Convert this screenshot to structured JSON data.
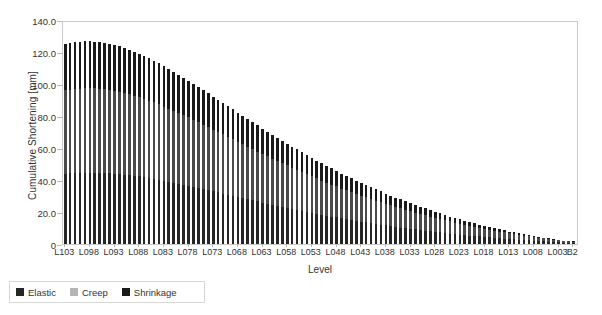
{
  "chart_data": {
    "type": "bar",
    "title": "",
    "subtitle": "",
    "xlabel": "Level",
    "ylabel": "Cumulative Shortening [mm]",
    "ylim": [
      0,
      140
    ],
    "ytick_labels": [
      "140.0",
      "120.0",
      "100.0",
      "80.0",
      "60.0",
      "40.0",
      "20.0",
      "0"
    ],
    "ytick_values": [
      140,
      120,
      100,
      80,
      60,
      40,
      20,
      0
    ],
    "grid": false,
    "legend_position": "below-left",
    "stacked": true,
    "bar_orientation": "vertical",
    "categories": [
      "L103",
      "L102",
      "L101",
      "L100",
      "L099",
      "L098",
      "L097",
      "L096",
      "L095",
      "L094",
      "L093",
      "L092",
      "L091",
      "L090",
      "L089",
      "L088",
      "L087",
      "L086",
      "L085",
      "L084",
      "L083",
      "L082",
      "L081",
      "L080",
      "L079",
      "L078",
      "L077",
      "L076",
      "L075",
      "L074",
      "L073",
      "L072",
      "L071",
      "L070",
      "L069",
      "L068",
      "L067",
      "L066",
      "L065",
      "L064",
      "L063",
      "L062",
      "L061",
      "L060",
      "L059",
      "L058",
      "L057",
      "L056",
      "L055",
      "L054",
      "L053",
      "L052",
      "L051",
      "L050",
      "L049",
      "L048",
      "L047",
      "L046",
      "L045",
      "L044",
      "L043",
      "L042",
      "L041",
      "L040",
      "L039",
      "L038",
      "L037",
      "L036",
      "L035",
      "L034",
      "L033",
      "L032",
      "L031",
      "L030",
      "L029",
      "L028",
      "L027",
      "L026",
      "L025",
      "L024",
      "L023",
      "L022",
      "L021",
      "L020",
      "L019",
      "L018",
      "L017",
      "L016",
      "L015",
      "L014",
      "L013",
      "L012",
      "L011",
      "L010",
      "L009",
      "L008",
      "L007",
      "L006",
      "L005",
      "L004",
      "L003",
      "L002",
      "L001",
      "B2"
    ],
    "xtick_labels": [
      "L103",
      "L098",
      "L093",
      "L088",
      "L083",
      "L078",
      "L073",
      "L068",
      "L063",
      "L058",
      "L053",
      "L048",
      "L043",
      "L038",
      "L033",
      "L028",
      "L023",
      "L018",
      "L013",
      "L008",
      "L003",
      "B2"
    ],
    "xtick_indices": [
      0,
      5,
      10,
      15,
      20,
      25,
      30,
      35,
      40,
      45,
      50,
      55,
      60,
      65,
      70,
      75,
      80,
      85,
      90,
      95,
      100,
      103
    ],
    "series": [
      {
        "name": "Elastic",
        "color": "#262626",
        "values": [
          44.0,
          44.2,
          44.4,
          44.5,
          44.6,
          44.6,
          44.6,
          44.5,
          44.4,
          44.2,
          44.0,
          43.7,
          43.4,
          43.0,
          42.6,
          42.2,
          41.7,
          41.2,
          40.7,
          40.1,
          39.5,
          38.9,
          38.3,
          37.7,
          37.0,
          36.4,
          35.7,
          35.0,
          34.3,
          33.6,
          32.9,
          32.2,
          31.5,
          30.8,
          30.1,
          29.4,
          28.7,
          28.0,
          27.3,
          26.6,
          25.9,
          25.2,
          24.5,
          23.9,
          23.2,
          22.6,
          21.9,
          21.3,
          20.7,
          20.1,
          19.5,
          18.9,
          18.3,
          17.7,
          17.1,
          16.6,
          16.0,
          15.5,
          15.0,
          14.5,
          14.0,
          13.5,
          13.0,
          12.5,
          12.1,
          11.6,
          11.2,
          10.7,
          10.3,
          9.9,
          9.5,
          9.1,
          8.7,
          8.3,
          7.9,
          7.6,
          7.2,
          6.9,
          6.5,
          6.2,
          5.9,
          5.6,
          5.3,
          5.0,
          4.7,
          4.4,
          4.1,
          3.9,
          3.6,
          3.4,
          3.1,
          2.9,
          2.7,
          2.5,
          2.2,
          2.0,
          1.8,
          1.6,
          1.5,
          1.3,
          1.1,
          0.9,
          0.8,
          0.7
        ]
      },
      {
        "name": "Creep",
        "color": "#4a4a4a",
        "values": [
          52.0,
          52.3,
          52.5,
          52.6,
          52.7,
          52.7,
          52.6,
          52.5,
          52.3,
          52.1,
          51.8,
          51.4,
          51.0,
          50.6,
          50.1,
          49.6,
          49.0,
          48.4,
          47.8,
          47.1,
          46.4,
          45.7,
          45.0,
          44.2,
          43.5,
          42.7,
          41.9,
          41.1,
          40.3,
          39.5,
          38.6,
          37.8,
          37.0,
          36.2,
          35.3,
          34.5,
          33.7,
          32.9,
          32.1,
          31.2,
          30.4,
          29.6,
          28.8,
          28.0,
          27.3,
          26.5,
          25.7,
          25.0,
          24.2,
          23.5,
          22.8,
          22.1,
          21.4,
          20.7,
          20.0,
          19.4,
          18.7,
          18.1,
          17.5,
          16.9,
          16.3,
          15.7,
          15.2,
          14.6,
          14.1,
          13.5,
          13.0,
          12.5,
          12.0,
          11.5,
          11.0,
          10.6,
          10.1,
          9.7,
          9.3,
          8.8,
          8.4,
          8.0,
          7.6,
          7.2,
          6.9,
          6.5,
          6.1,
          5.8,
          5.5,
          5.1,
          4.8,
          4.5,
          4.2,
          3.9,
          3.6,
          3.4,
          3.1,
          2.8,
          2.6,
          2.4,
          2.1,
          1.9,
          1.7,
          1.5,
          1.3,
          1.1,
          0.9,
          0.8
        ]
      },
      {
        "name": "Shrinkage",
        "color": "#1a1a1a",
        "values": [
          29.0,
          29.1,
          29.2,
          29.3,
          29.3,
          29.3,
          29.2,
          29.1,
          29.0,
          28.8,
          28.6,
          28.4,
          28.1,
          27.8,
          27.5,
          27.2,
          26.8,
          26.5,
          26.1,
          25.7,
          25.3,
          24.8,
          24.4,
          23.9,
          23.5,
          23.0,
          22.5,
          22.1,
          21.6,
          21.1,
          20.6,
          20.1,
          19.6,
          19.2,
          18.7,
          18.2,
          17.7,
          17.3,
          16.8,
          16.3,
          15.9,
          15.4,
          15.0,
          14.5,
          14.1,
          13.7,
          13.2,
          12.8,
          12.4,
          12.0,
          11.6,
          11.2,
          10.8,
          10.4,
          10.1,
          9.7,
          9.3,
          9.0,
          8.6,
          8.3,
          8.0,
          7.6,
          7.3,
          7.0,
          6.7,
          6.4,
          6.1,
          5.8,
          5.6,
          5.3,
          5.0,
          4.8,
          4.5,
          4.3,
          4.0,
          3.8,
          3.6,
          3.4,
          3.1,
          2.9,
          2.7,
          2.5,
          2.4,
          2.2,
          2.0,
          1.8,
          1.7,
          1.5,
          1.4,
          1.2,
          1.1,
          1.0,
          0.9,
          0.8,
          0.7,
          0.6,
          0.5,
          0.5,
          0.4,
          0.3,
          0.3,
          0.2,
          0.2,
          0.1
        ]
      }
    ],
    "totals": [
      125.0,
      125.6,
      126.1,
      126.4,
      126.6,
      126.6,
      126.4,
      126.1,
      125.7,
      125.1,
      124.4,
      123.5,
      122.5,
      121.4,
      120.2,
      119.0,
      117.5,
      116.1,
      114.6,
      112.9,
      111.2,
      109.4,
      107.7,
      105.8,
      104.0,
      102.1,
      100.1,
      98.2,
      96.2,
      94.2,
      92.1,
      90.1,
      88.1,
      86.2,
      84.1,
      82.1,
      80.1,
      78.2,
      76.2,
      74.1,
      72.2,
      70.2,
      68.3,
      66.4,
      64.6,
      62.8,
      60.8,
      59.1,
      57.3,
      55.6,
      53.9,
      52.2,
      50.5,
      48.8,
      47.2,
      45.7,
      44.0,
      42.6,
      41.1,
      39.7,
      38.3,
      36.8,
      35.5,
      34.1,
      32.9,
      31.5,
      30.3,
      29.0,
      27.9,
      26.7,
      25.5,
      24.5,
      23.3,
      22.3,
      21.2,
      20.2,
      19.2,
      18.3,
      17.2,
      16.3,
      15.5,
      14.6,
      13.8,
      13.0,
      12.2,
      11.3,
      10.6,
      9.9,
      9.2,
      8.5,
      7.8,
      7.3,
      6.7,
      6.1,
      5.5,
      5.0,
      4.4,
      4.0,
      3.6,
      3.1,
      2.7,
      2.2,
      1.9,
      1.6
    ]
  },
  "legend": {
    "items": [
      {
        "label": "Elastic",
        "color": "#262626"
      },
      {
        "label": "Creep",
        "color": "#b5b5b5"
      },
      {
        "label": "Shrinkage",
        "color": "#1a1a1a"
      }
    ]
  }
}
